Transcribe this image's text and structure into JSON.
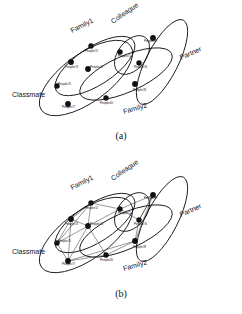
{
  "figure": {
    "type": "diagram",
    "panels": [
      {
        "id": "a",
        "caption": "(a)",
        "edges_visible": false
      },
      {
        "id": "b",
        "caption": "(b)",
        "edges_visible": true
      }
    ]
  },
  "groups": [
    {
      "id": "family1",
      "label": "Family1",
      "cx": 95,
      "cy": 66,
      "rx": 46,
      "ry": 19,
      "rot": -33,
      "label_x": 72,
      "label_y": 33,
      "label_rot": -27
    },
    {
      "id": "family2",
      "label": "Family2",
      "cx": 126,
      "cy": 74,
      "rx": 50,
      "ry": 18,
      "rot": -24,
      "label_x": 124,
      "label_y": 114,
      "label_rot": -16
    },
    {
      "id": "colleague",
      "label": "Colleague",
      "cx": 132,
      "cy": 55,
      "rx": 22,
      "ry": 14,
      "rot": -52,
      "label_x": 113,
      "label_y": 24,
      "label_rot": -35
    },
    {
      "id": "partner",
      "label": "Partner",
      "cx": 162,
      "cy": 62,
      "rx": 47,
      "ry": 16,
      "rot": -63,
      "label_x": 181,
      "label_y": 60,
      "label_rot": -24
    },
    {
      "id": "classmate",
      "label": "Classmate",
      "cx": 86,
      "cy": 78,
      "rx": 55,
      "ry": 24,
      "rot": -36,
      "label_x": 12,
      "label_y": 97,
      "label_rot": 0
    }
  ],
  "nodes": [
    {
      "id": "p1",
      "label": "People#1",
      "x": 120,
      "y": 52,
      "lx": 118,
      "ly": 57,
      "r": 2.7
    },
    {
      "id": "p2",
      "label": "People#2",
      "x": 91,
      "y": 46,
      "lx": 85,
      "ly": 52,
      "r": 2.7
    },
    {
      "id": "p3",
      "label": "People#3",
      "x": 71,
      "y": 62,
      "lx": 65,
      "ly": 68,
      "r": 2.9
    },
    {
      "id": "p4",
      "label": "People#4",
      "x": 88,
      "y": 69,
      "lx": 90,
      "ly": 68,
      "r": 2.9
    },
    {
      "id": "p5",
      "label": "People#5",
      "x": 57,
      "y": 86,
      "lx": 58,
      "ly": 85,
      "r": 2.7
    },
    {
      "id": "p6",
      "label": "People#6",
      "x": 139,
      "y": 63,
      "lx": 134,
      "ly": 68,
      "r": 2.7
    },
    {
      "id": "p7",
      "label": "People#7",
      "x": 68,
      "y": 104,
      "lx": 62,
      "ly": 108,
      "r": 2.9
    },
    {
      "id": "p8",
      "label": "People#8",
      "x": 135,
      "y": 84,
      "lx": 133,
      "ly": 91,
      "r": 2.9
    },
    {
      "id": "p9",
      "label": "People#9",
      "x": 153,
      "y": 38,
      "lx": 144,
      "ly": 42,
      "r": 2.9
    },
    {
      "id": "p10",
      "label": "People10",
      "x": 106,
      "y": 98,
      "lx": 100,
      "ly": 104,
      "r": 2.7
    }
  ],
  "edges": [
    {
      "source": "p1",
      "target": "p2"
    },
    {
      "source": "p1",
      "target": "p6"
    },
    {
      "source": "p1",
      "target": "p9"
    },
    {
      "source": "p1",
      "target": "p4"
    },
    {
      "source": "p2",
      "target": "p3"
    },
    {
      "source": "p2",
      "target": "p4"
    },
    {
      "source": "p2",
      "target": "p5"
    },
    {
      "source": "p3",
      "target": "p4"
    },
    {
      "source": "p3",
      "target": "p5"
    },
    {
      "source": "p3",
      "target": "p7"
    },
    {
      "source": "p4",
      "target": "p5"
    },
    {
      "source": "p4",
      "target": "p7"
    },
    {
      "source": "p4",
      "target": "p10"
    },
    {
      "source": "p5",
      "target": "p7"
    },
    {
      "source": "p6",
      "target": "p8"
    },
    {
      "source": "p6",
      "target": "p9"
    },
    {
      "source": "p7",
      "target": "p8"
    },
    {
      "source": "p7",
      "target": "p10"
    },
    {
      "source": "p8",
      "target": "p9"
    },
    {
      "source": "p8",
      "target": "p10"
    },
    {
      "source": "p9",
      "target": "p6"
    }
  ],
  "colors": {
    "background": "#ffffff",
    "stroke": "#111111",
    "node_fill": "#111111",
    "edge": "#333333"
  }
}
